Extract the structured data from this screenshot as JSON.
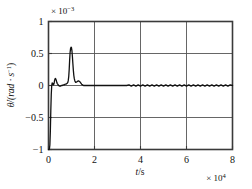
{
  "figure": {
    "background_color": "#ffffff",
    "frame_color": "#3a3a3a",
    "grid_color": "#555555",
    "curve_color": "#111111"
  },
  "labels": {
    "y_exponent_prefix": "× 10",
    "y_exponent_power": "−3",
    "x_exponent_prefix": "× 10",
    "x_exponent_power": "4",
    "x_axis_title_var": "t",
    "x_axis_title_rest": "/s",
    "y_axis_title": "θ̇/(rad · s",
    "y_axis_title_sup": "−1",
    "y_axis_title_close": ")"
  },
  "chart_data": {
    "type": "line",
    "title": "",
    "xlabel": "t/s",
    "ylabel": "θ̇/(rad·s⁻¹)",
    "x_scale_factor": "×10⁴",
    "y_scale_factor": "×10⁻³",
    "xlim": [
      0,
      8
    ],
    "ylim": [
      -1,
      1
    ],
    "xticks": [
      0,
      2,
      4,
      6,
      8
    ],
    "yticks": [
      -1,
      -0.5,
      0,
      0.5,
      1
    ],
    "xticklabels": [
      "0",
      "2",
      "4",
      "6",
      "8"
    ],
    "yticklabels": [
      "−1",
      "−0.5",
      "0",
      "0.5",
      "1"
    ],
    "grid": true,
    "grid_x": [
      2,
      4,
      6
    ],
    "grid_y": [
      -0.5,
      0,
      0.5
    ],
    "legend": null,
    "series": [
      {
        "name": "angular velocity",
        "x": [
          0.0,
          0.02,
          0.04,
          0.06,
          0.08,
          0.1,
          0.12,
          0.14,
          0.16,
          0.18,
          0.2,
          0.22,
          0.24,
          0.26,
          0.28,
          0.3,
          0.32,
          0.34,
          0.36,
          0.38,
          0.4,
          0.44,
          0.48,
          0.52,
          0.56,
          0.6,
          0.64,
          0.68,
          0.72,
          0.76,
          0.8,
          0.84,
          0.86,
          0.88,
          0.9,
          0.92,
          0.94,
          0.96,
          0.98,
          1.0,
          1.02,
          1.04,
          1.06,
          1.08,
          1.1,
          1.12,
          1.14,
          1.16,
          1.18,
          1.2,
          1.24,
          1.28,
          1.32,
          1.36,
          1.4,
          1.44,
          1.48,
          1.52,
          1.56,
          1.6,
          1.7,
          1.8,
          1.9,
          2.0,
          2.2,
          2.4,
          2.6,
          2.8,
          3.0,
          3.2,
          3.4,
          3.5,
          3.6,
          3.7,
          3.8,
          3.9,
          4.0,
          4.1,
          4.2,
          4.3,
          4.4,
          4.5,
          4.6,
          4.7,
          4.8,
          4.9,
          5.0,
          5.1,
          5.2,
          5.3,
          5.4,
          5.5,
          5.6,
          5.7,
          5.8,
          5.9,
          6.0,
          6.1,
          6.2,
          6.3,
          6.4,
          6.5,
          6.6,
          6.7,
          6.8,
          6.9,
          7.0,
          7.1,
          7.2,
          7.3,
          7.4,
          7.5,
          7.6,
          7.7,
          7.8,
          7.9,
          8.0
        ],
        "y": [
          -1.0,
          -1.0,
          -0.99,
          -0.93,
          -0.72,
          -0.4,
          -0.14,
          0.0,
          0.04,
          0.03,
          0.01,
          0.01,
          0.03,
          0.07,
          0.1,
          0.11,
          0.1,
          0.08,
          0.05,
          0.03,
          0.02,
          0.0,
          -0.01,
          -0.01,
          0.0,
          0.0,
          0.01,
          0.01,
          0.02,
          0.02,
          0.03,
          0.05,
          0.08,
          0.14,
          0.25,
          0.4,
          0.52,
          0.58,
          0.6,
          0.59,
          0.54,
          0.45,
          0.34,
          0.24,
          0.16,
          0.11,
          0.08,
          0.06,
          0.05,
          0.05,
          0.06,
          0.07,
          0.07,
          0.06,
          0.04,
          0.02,
          0.01,
          0.0,
          0.0,
          0.0,
          0.0,
          0.0,
          0.0,
          0.0,
          0.0,
          0.0,
          0.0,
          0.0,
          0.0,
          0.0,
          0.0,
          0.01,
          -0.01,
          0.01,
          -0.01,
          0.01,
          -0.01,
          0.01,
          -0.01,
          0.01,
          -0.01,
          0.01,
          -0.01,
          0.01,
          -0.01,
          0.01,
          -0.01,
          0.01,
          -0.01,
          0.01,
          -0.01,
          0.01,
          -0.01,
          0.01,
          -0.01,
          0.01,
          -0.01,
          0.01,
          -0.01,
          0.01,
          -0.01,
          0.01,
          -0.01,
          0.01,
          -0.01,
          0.01,
          -0.01,
          0.01,
          -0.01,
          0.01,
          -0.01,
          0.01,
          -0.01,
          0.01,
          -0.01,
          0.01,
          0.0
        ]
      }
    ],
    "annotations": [
      {
        "text": "initial value ≈ −1×10⁻³ rad/s at t=0"
      },
      {
        "text": "main peak ≈ 0.6×10⁻³ rad/s near t=1×10⁴ s"
      },
      {
        "text": "small secondary bump ≈ 0.11×10⁻³ near t=0.3×10⁴ s"
      },
      {
        "text": "steady state ≈ 0 with small ripple after t≈3.5×10⁴ s"
      }
    ]
  }
}
